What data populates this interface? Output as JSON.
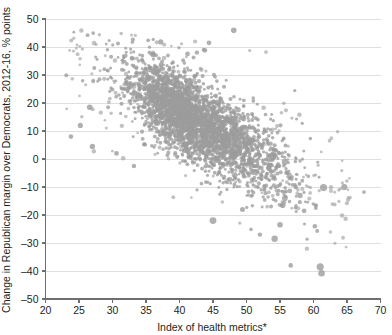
{
  "chart_data": {
    "type": "scatter",
    "title": "",
    "title_clipped": true,
    "xlabel": "Index of health metrics*",
    "ylabel": "Change in Republican margin over Democrats, 2012-16, % points",
    "xlim": [
      20,
      70
    ],
    "ylim": [
      -50,
      50
    ],
    "xticks": [
      20,
      25,
      30,
      35,
      40,
      45,
      50,
      55,
      60,
      65,
      70
    ],
    "yticks": [
      50,
      40,
      30,
      20,
      10,
      0,
      -10,
      -20,
      -30,
      -40,
      -50
    ],
    "xtick_labels": [
      "20",
      "25",
      "30",
      "35",
      "40",
      "45",
      "50",
      "55",
      "60",
      "65",
      "70"
    ],
    "ytick_labels": [
      "50",
      "40",
      "30",
      "20",
      "10",
      "0",
      "-10",
      "-20",
      "-30",
      "-40",
      "-50"
    ],
    "grid": true,
    "grid_axis": "y",
    "legend": false,
    "marker_color": "#9c9c9c",
    "marker_opacity": 0.78,
    "point_count": 3100,
    "correlation": -0.62,
    "cloud": {
      "x_mean": 42.0,
      "x_sd": 4.6,
      "y_mean": 14.0,
      "y_sd": 7.0,
      "slope": -1.35,
      "description": "Dense negatively-sloping cloud of US counties; bulk spans x 30-55, y 0-32, thinning to the lower right."
    },
    "outliers": [
      {
        "x": 48.1,
        "y": 46.0,
        "r": 2.8
      },
      {
        "x": 44.4,
        "y": 41.5,
        "r": 2.4
      },
      {
        "x": 37.2,
        "y": 41.8,
        "r": 2.6
      },
      {
        "x": 41.2,
        "y": 37.5,
        "r": 2.4
      },
      {
        "x": 42.6,
        "y": 38.0,
        "r": 2.2
      },
      {
        "x": 43.8,
        "y": 38.8,
        "r": 2.3
      },
      {
        "x": 26.6,
        "y": 18.5,
        "r": 2.8
      },
      {
        "x": 25.2,
        "y": 12.0,
        "r": 2.6
      },
      {
        "x": 23.8,
        "y": 8.0,
        "r": 2.3
      },
      {
        "x": 27.0,
        "y": 4.5,
        "r": 2.7
      },
      {
        "x": 30.6,
        "y": 2.0,
        "r": 2.4
      },
      {
        "x": 33.2,
        "y": -2.5,
        "r": 2.2
      },
      {
        "x": 61.5,
        "y": -10.2,
        "r": 3.6
      },
      {
        "x": 64.6,
        "y": -10.0,
        "r": 3.1
      },
      {
        "x": 58.0,
        "y": -13.0,
        "r": 2.6
      },
      {
        "x": 55.4,
        "y": -16.5,
        "r": 2.8
      },
      {
        "x": 49.4,
        "y": -18.0,
        "r": 2.5
      },
      {
        "x": 58.6,
        "y": -18.5,
        "r": 2.4
      },
      {
        "x": 45.0,
        "y": -22.0,
        "r": 3.4
      },
      {
        "x": 55.0,
        "y": -23.5,
        "r": 2.8
      },
      {
        "x": 60.2,
        "y": -24.0,
        "r": 2.3
      },
      {
        "x": 54.2,
        "y": -28.5,
        "r": 3.2
      },
      {
        "x": 52.0,
        "y": -27.0,
        "r": 2.2
      },
      {
        "x": 61.0,
        "y": -38.5,
        "r": 3.6
      },
      {
        "x": 61.2,
        "y": -40.8,
        "r": 3.3
      },
      {
        "x": 56.6,
        "y": -38.0,
        "r": 2.3
      }
    ]
  },
  "axes": {
    "y_axis_label": "Change in Republican margin over Democrats, 2012-16, % points",
    "x_axis_label": "Index of health metrics*"
  }
}
